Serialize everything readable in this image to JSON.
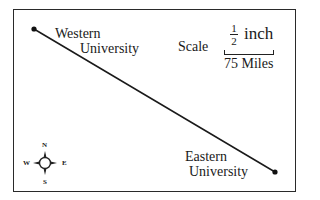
{
  "map": {
    "points": [
      {
        "name": "Western",
        "line2": "University",
        "x": 34,
        "y": 29
      },
      {
        "name": "Eastern",
        "line2": "University",
        "x": 275,
        "y": 172
      }
    ],
    "scale": {
      "label": "Scale",
      "fraction_numerator": "1",
      "fraction_denominator": "2",
      "unit": "inch",
      "distance": "75 Miles"
    },
    "compass": {
      "n": "N",
      "s": "S",
      "e": "E",
      "w": "W"
    },
    "colors": {
      "line": "#1a1a1a",
      "border": "#2a2a2a",
      "background": "#ffffff"
    }
  }
}
